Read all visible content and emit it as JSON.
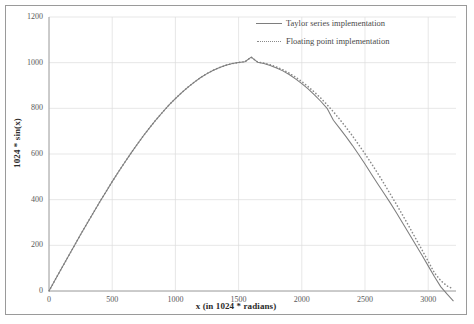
{
  "chart_data": {
    "type": "line",
    "title": "",
    "xlabel": "x (in 1024 * radians)",
    "ylabel": "1024 * sin(x)",
    "xlim": [
      0,
      3220
    ],
    "ylim": [
      0,
      1200
    ],
    "xticks": [
      0,
      500,
      1000,
      1500,
      2000,
      2500,
      3000
    ],
    "yticks": [
      0,
      200,
      400,
      600,
      800,
      1000,
      1200
    ],
    "xtick_labels": [
      "0",
      "500",
      "1000",
      "1500",
      "2000",
      "2500",
      "3000"
    ],
    "ytick_labels": [
      "0",
      "200",
      "400",
      "600",
      "800",
      "1000",
      "1200"
    ],
    "grid": true,
    "legend_position": "top-right",
    "legend": [
      "Taylor series implementation",
      "Floating point implementation"
    ],
    "colors": {
      "taylor_line": "#7e7e7e",
      "floating_line": "#8a8a8a",
      "grid": "#dcdcdc",
      "axis": "#b4b4b4",
      "frame": "#9a9a9a",
      "text": "#4a4a4a"
    },
    "x": [
      0,
      50,
      100,
      150,
      200,
      250,
      300,
      350,
      400,
      450,
      500,
      550,
      600,
      650,
      700,
      750,
      800,
      850,
      900,
      950,
      1000,
      1050,
      1100,
      1150,
      1200,
      1250,
      1300,
      1350,
      1400,
      1450,
      1500,
      1550,
      1600,
      1650,
      1700,
      1750,
      1800,
      1850,
      1900,
      1950,
      2000,
      2050,
      2100,
      2150,
      2200,
      2250,
      2300,
      2350,
      2400,
      2450,
      2500,
      2550,
      2600,
      2650,
      2700,
      2750,
      2800,
      2850,
      2900,
      2950,
      3000,
      3050,
      3100,
      3150,
      3200
    ],
    "series": [
      {
        "name": "Taylor series implementation",
        "style": "solid",
        "values": [
          0,
          50,
          100,
          149,
          198,
          247,
          295,
          342,
          389,
          434,
          479,
          522,
          564,
          605,
          644,
          682,
          718,
          752,
          784,
          815,
          843,
          869,
          893,
          915,
          935,
          952,
          967,
          979,
          989,
          996,
          1001,
          1004,
          1024,
          1002,
          996,
          988,
          977,
          964,
          948,
          929,
          908,
          885,
          859,
          831,
          800,
          748,
          712,
          676,
          638,
          598,
          556,
          512,
          470,
          428,
          386,
          342,
          296,
          250,
          204,
          158,
          110,
          62,
          18,
          -14,
          -44
        ]
      },
      {
        "name": "Floating point implementation",
        "style": "dotted",
        "values": [
          0,
          50,
          100,
          149,
          198,
          247,
          295,
          342,
          389,
          434,
          479,
          522,
          564,
          605,
          644,
          682,
          718,
          752,
          784,
          815,
          843,
          869,
          893,
          915,
          935,
          952,
          967,
          979,
          989,
          996,
          1001,
          1004,
          1024,
          1003,
          998,
          991,
          981,
          969,
          954,
          937,
          917,
          895,
          871,
          845,
          816,
          785,
          752,
          717,
          680,
          641,
          601,
          559,
          516,
          471,
          425,
          378,
          330,
          281,
          231,
          181,
          130,
          79,
          45,
          22,
          8
        ]
      }
    ]
  },
  "axis_labels": {
    "x": "x (in 1024 * radians)",
    "y": "1024 * sin(x)"
  }
}
